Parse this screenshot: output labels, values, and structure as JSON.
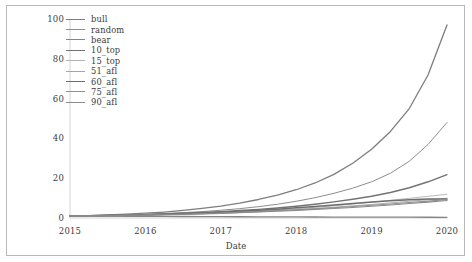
{
  "chart_data": {
    "type": "line",
    "title": "",
    "xlabel": "Date",
    "ylabel": "",
    "xlim": [
      2015,
      2020
    ],
    "ylim": [
      0,
      100
    ],
    "xticks": [
      "2015",
      "2016",
      "2017",
      "2018",
      "2019",
      "2020"
    ],
    "yticks": [
      "0",
      "20",
      "40",
      "60",
      "80",
      "100"
    ],
    "grid": false,
    "legend_position": "upper-left",
    "x": [
      2015.0,
      2015.25,
      2015.5,
      2015.75,
      2016.0,
      2016.25,
      2016.5,
      2016.75,
      2017.0,
      2017.25,
      2017.5,
      2017.75,
      2018.0,
      2018.25,
      2018.5,
      2018.75,
      2019.0,
      2019.25,
      2019.5,
      2019.75,
      2020.0
    ],
    "series": [
      {
        "name": "bull",
        "color": "#7d7d7d",
        "width": 1.3,
        "values": [
          1.0,
          1.2,
          1.5,
          1.9,
          2.4,
          3.0,
          3.8,
          4.8,
          6.0,
          7.5,
          9.3,
          11.5,
          14.2,
          17.6,
          21.9,
          27.5,
          34.5,
          43.5,
          55.0,
          72.0,
          97.0
        ]
      },
      {
        "name": "random",
        "color": "#8e8e8e",
        "width": 1.0,
        "values": [
          1.0,
          1.15,
          1.35,
          1.6,
          1.9,
          2.25,
          2.7,
          3.2,
          3.9,
          4.7,
          5.7,
          6.9,
          8.4,
          10.2,
          12.4,
          15.0,
          18.2,
          22.5,
          28.5,
          37.0,
          48.0
        ]
      },
      {
        "name": "bear",
        "color": "#868686",
        "width": 1.3,
        "values": [
          1.0,
          0.96,
          0.92,
          0.88,
          0.84,
          0.8,
          0.76,
          0.72,
          0.68,
          0.64,
          0.6,
          0.57,
          0.54,
          0.51,
          0.48,
          0.45,
          0.43,
          0.41,
          0.39,
          0.37,
          0.35
        ]
      },
      {
        "name": "10_top",
        "color": "#737373",
        "width": 1.4,
        "values": [
          1.0,
          1.1,
          1.25,
          1.45,
          1.7,
          2.0,
          2.35,
          2.75,
          3.2,
          3.75,
          4.35,
          5.05,
          5.9,
          6.9,
          8.1,
          9.4,
          10.9,
          12.8,
          15.2,
          18.2,
          21.8
        ]
      },
      {
        "name": "15_top",
        "color": "#b3b3b3",
        "width": 0.9,
        "values": [
          1.0,
          1.08,
          1.2,
          1.35,
          1.55,
          1.78,
          2.05,
          2.35,
          2.7,
          3.1,
          3.55,
          4.05,
          4.65,
          5.35,
          6.1,
          7.0,
          7.9,
          8.9,
          9.9,
          10.9,
          11.9
        ]
      },
      {
        "name": "51_afl",
        "color": "#a6a6a6",
        "width": 0.9,
        "values": [
          1.0,
          1.07,
          1.18,
          1.32,
          1.5,
          1.7,
          1.95,
          2.22,
          2.55,
          2.9,
          3.3,
          3.75,
          4.25,
          4.8,
          5.4,
          6.1,
          6.8,
          7.6,
          8.4,
          9.2,
          9.9
        ]
      },
      {
        "name": "60_afl",
        "color": "#6e6e6e",
        "width": 1.5,
        "values": [
          1.0,
          1.09,
          1.22,
          1.4,
          1.62,
          1.88,
          2.2,
          2.55,
          2.95,
          3.4,
          3.9,
          4.45,
          5.1,
          5.8,
          6.55,
          7.3,
          8.05,
          8.7,
          9.2,
          9.5,
          9.6
        ]
      },
      {
        "name": "75_afl",
        "color": "#909090",
        "width": 1.1,
        "values": [
          1.0,
          1.06,
          1.16,
          1.3,
          1.47,
          1.67,
          1.9,
          2.17,
          2.47,
          2.82,
          3.2,
          3.62,
          4.1,
          4.6,
          5.15,
          5.75,
          6.4,
          7.05,
          7.8,
          8.5,
          9.3
        ]
      },
      {
        "name": "90_afl",
        "color": "#8a8a8a",
        "width": 1.1,
        "values": [
          1.0,
          1.05,
          1.14,
          1.26,
          1.42,
          1.6,
          1.82,
          2.06,
          2.34,
          2.65,
          3.0,
          3.38,
          3.8,
          4.26,
          4.76,
          5.3,
          5.9,
          6.55,
          7.25,
          8.0,
          8.8
        ]
      }
    ]
  }
}
